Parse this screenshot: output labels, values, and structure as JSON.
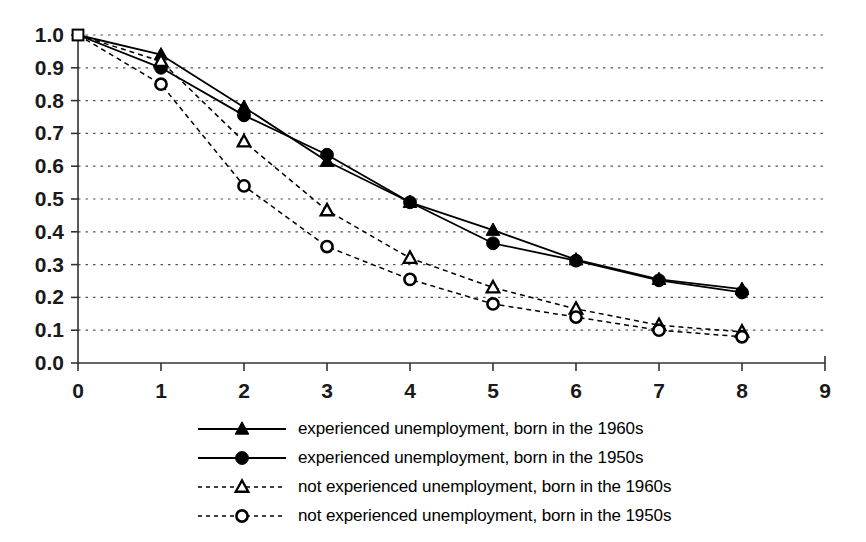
{
  "chart_data": {
    "type": "line",
    "title": "",
    "xlabel": "",
    "ylabel": "",
    "xlim": [
      0,
      9
    ],
    "ylim": [
      0.0,
      1.0
    ],
    "grid": true,
    "legend_position": "bottom",
    "x": [
      0,
      1,
      2,
      3,
      4,
      5,
      6,
      7,
      8
    ],
    "xticks": [
      "0",
      "1",
      "2",
      "3",
      "4",
      "5",
      "6",
      "7",
      "8",
      "9"
    ],
    "yticks": [
      "0.0",
      "0.1",
      "0.2",
      "0.3",
      "0.4",
      "0.5",
      "0.6",
      "0.7",
      "0.8",
      "0.9",
      "1.0"
    ],
    "series": [
      {
        "name": "experienced unemployment, born in the 1960s",
        "marker": "filled-triangle",
        "line": "solid",
        "color": "#000000",
        "values": [
          1.0,
          0.94,
          0.78,
          0.615,
          0.49,
          0.405,
          0.315,
          0.255,
          0.225
        ]
      },
      {
        "name": "experienced unemployment, born in the 1950s",
        "marker": "filled-circle",
        "line": "solid",
        "color": "#000000",
        "values": [
          1.0,
          0.9,
          0.755,
          0.635,
          0.49,
          0.365,
          0.312,
          0.252,
          0.215
        ]
      },
      {
        "name": "not experienced unemployment, born in the 1960s",
        "marker": "open-triangle",
        "line": "dotted",
        "color": "#000000",
        "values": [
          1.0,
          0.92,
          0.675,
          0.465,
          0.32,
          0.23,
          0.165,
          0.115,
          0.095
        ]
      },
      {
        "name": "not experienced unemployment, born in the 1950s",
        "marker": "open-circle",
        "line": "dotted",
        "color": "#000000",
        "values": [
          1.0,
          0.85,
          0.54,
          0.355,
          0.255,
          0.18,
          0.14,
          0.1,
          0.08
        ]
      }
    ]
  },
  "legend": {
    "items": [
      {
        "label": "experienced unemployment, born in the 1960s",
        "marker": "filled-triangle",
        "line": "solid"
      },
      {
        "label": "experienced unemployment, born in the 1950s",
        "marker": "filled-circle",
        "line": "solid"
      },
      {
        "label": "not experienced unemployment, born in the 1960s",
        "marker": "open-triangle",
        "line": "dotted"
      },
      {
        "label": "not experienced unemployment, born in the 1950s",
        "marker": "open-circle",
        "line": "dotted"
      }
    ]
  },
  "axes": {
    "y_labels": [
      "1.0",
      "0.9",
      "0.8",
      "0.7",
      "0.6",
      "0.5",
      "0.4",
      "0.3",
      "0.2",
      "0.1",
      "0.0"
    ],
    "x_labels": [
      "0",
      "1",
      "2",
      "3",
      "4",
      "5",
      "6",
      "7",
      "8",
      "9"
    ]
  }
}
